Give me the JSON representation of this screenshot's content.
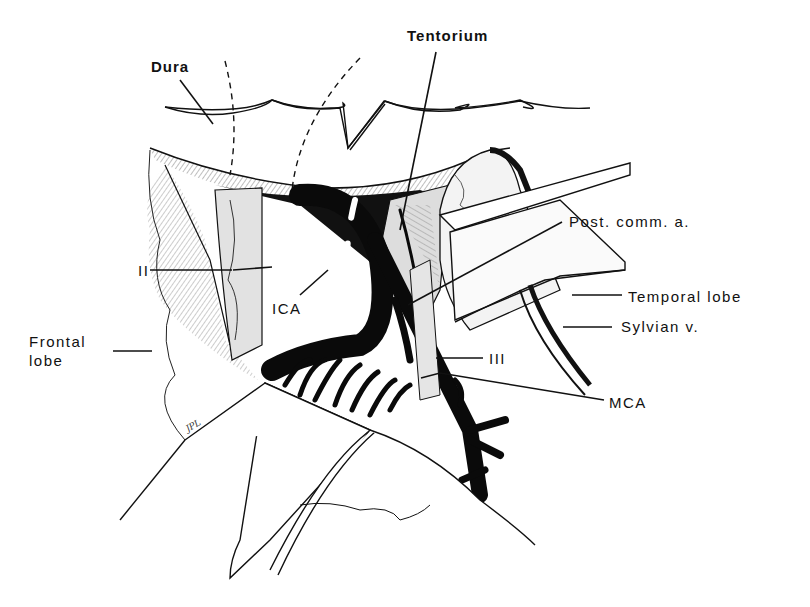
{
  "figure": {
    "type": "anatomical-illustration",
    "colors": {
      "ink": "#111111",
      "background": "#ffffff",
      "shade": "#d9d9d9"
    }
  },
  "labels": {
    "dura": "Dura",
    "tentorium": "Tentorium",
    "post_comm_a": "Post. comm. a.",
    "temporal_lobe": "Temporal lobe",
    "sylvian_v": "Sylvian v.",
    "ii": "II",
    "ica": "ICA",
    "frontal_lobe": "Frontal\nlobe",
    "iii": "III",
    "mca": "MCA"
  },
  "signature": "JPL"
}
